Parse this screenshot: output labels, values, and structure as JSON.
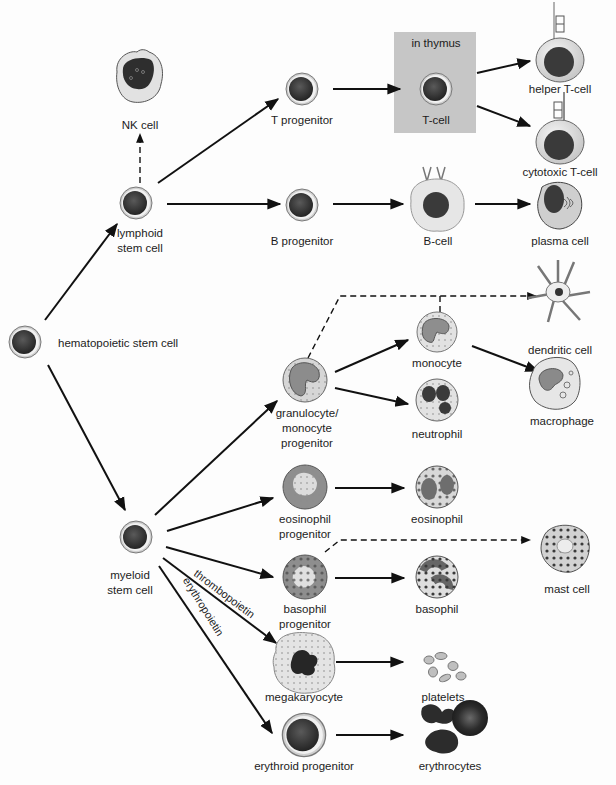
{
  "diagram": {
    "colors": {
      "line": "#111111",
      "thymus_box": "#c6c6c6",
      "stem_nucleus": "#3a3a3a",
      "cell_membrane": "#d9d9d9",
      "granule": "#555555",
      "cytoplasm": "#e4e4e4"
    },
    "cells": {
      "hsc": "hematopoietic stem cell",
      "lymphoid": [
        "lymphoid",
        "stem cell"
      ],
      "myeloid": [
        "myeloid",
        "stem cell"
      ],
      "nk": "NK cell",
      "t_progenitor": "T progenitor",
      "b_progenitor": "B progenitor",
      "thymus_label": "in thymus",
      "t_cell": "T-cell",
      "helper_t": "helper T-cell",
      "cytotoxic_t": "cytotoxic T-cell",
      "b_cell": "B-cell",
      "plasma": "plasma cell",
      "gran_mono": [
        "granulocyte/",
        "monocyte",
        "progenitor"
      ],
      "monocyte": "monocyte",
      "neutrophil": "neutrophil",
      "dendritic": "dendritic cell",
      "macrophage": "macrophage",
      "eos_prog": [
        "eosinophil",
        "progenitor"
      ],
      "eosinophil": "eosinophil",
      "baso_prog": [
        "basophil",
        "progenitor"
      ],
      "basophil": "basophil",
      "mast": "mast cell",
      "megakaryocyte": "megakaryocyte",
      "platelets": "platelets",
      "erythroid_prog": "erythroid progenitor",
      "erythrocytes": "erythrocytes"
    },
    "edge_labels": {
      "thrombopoietin": "thrombopoietin",
      "erythropoietin": "erythropoietin"
    },
    "edges": [
      {
        "from": "hematopoietic stem cell",
        "to": "lymphoid stem cell",
        "style": "solid"
      },
      {
        "from": "hematopoietic stem cell",
        "to": "myeloid stem cell",
        "style": "solid"
      },
      {
        "from": "lymphoid stem cell",
        "to": "NK cell",
        "style": "dashed"
      },
      {
        "from": "lymphoid stem cell",
        "to": "T progenitor",
        "style": "solid"
      },
      {
        "from": "lymphoid stem cell",
        "to": "B progenitor",
        "style": "solid"
      },
      {
        "from": "T progenitor",
        "to": "T-cell",
        "style": "solid"
      },
      {
        "from": "T-cell",
        "to": "helper T-cell",
        "style": "solid"
      },
      {
        "from": "T-cell",
        "to": "cytotoxic T-cell",
        "style": "solid"
      },
      {
        "from": "B progenitor",
        "to": "B-cell",
        "style": "solid"
      },
      {
        "from": "B-cell",
        "to": "plasma cell",
        "style": "solid"
      },
      {
        "from": "myeloid stem cell",
        "to": "granulocyte/monocyte progenitor",
        "style": "solid"
      },
      {
        "from": "myeloid stem cell",
        "to": "eosinophil progenitor",
        "style": "solid"
      },
      {
        "from": "myeloid stem cell",
        "to": "basophil progenitor",
        "style": "solid"
      },
      {
        "from": "myeloid stem cell",
        "to": "megakaryocyte",
        "style": "solid",
        "label": "thrombopoietin"
      },
      {
        "from": "myeloid stem cell",
        "to": "erythroid progenitor",
        "style": "solid",
        "label": "erythropoietin"
      },
      {
        "from": "granulocyte/monocyte progenitor",
        "to": "monocyte",
        "style": "solid"
      },
      {
        "from": "granulocyte/monocyte progenitor",
        "to": "neutrophil",
        "style": "solid"
      },
      {
        "from": "granulocyte/monocyte progenitor",
        "to": "dendritic cell",
        "style": "dashed"
      },
      {
        "from": "monocyte",
        "to": "dendritic cell",
        "style": "dashed"
      },
      {
        "from": "monocyte",
        "to": "macrophage",
        "style": "solid"
      },
      {
        "from": "eosinophil progenitor",
        "to": "eosinophil",
        "style": "solid"
      },
      {
        "from": "basophil progenitor",
        "to": "basophil",
        "style": "solid"
      },
      {
        "from": "basophil progenitor",
        "to": "mast cell",
        "style": "dashed"
      },
      {
        "from": "megakaryocyte",
        "to": "platelets",
        "style": "solid"
      },
      {
        "from": "erythroid progenitor",
        "to": "erythrocytes",
        "style": "solid"
      }
    ]
  }
}
